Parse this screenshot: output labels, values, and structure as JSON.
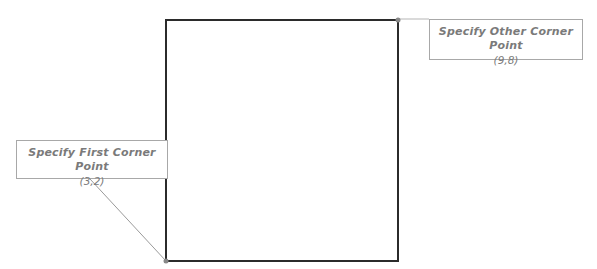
{
  "diagram": {
    "rectangle": {
      "x1": 166,
      "y1": 20,
      "x2": 398,
      "y2": 261,
      "stroke": "#2b2b2b"
    },
    "first_corner": {
      "label": "Specify First Corner Point",
      "coord": "(3,2)"
    },
    "other_corner": {
      "label": "Specify Other Corner Point",
      "coord": "(9,8)"
    },
    "colors": {
      "callout_text": "#7a7a7a",
      "callout_border": "#a8a8a8",
      "leader": "#9a9a9a",
      "point": "#888888"
    }
  }
}
